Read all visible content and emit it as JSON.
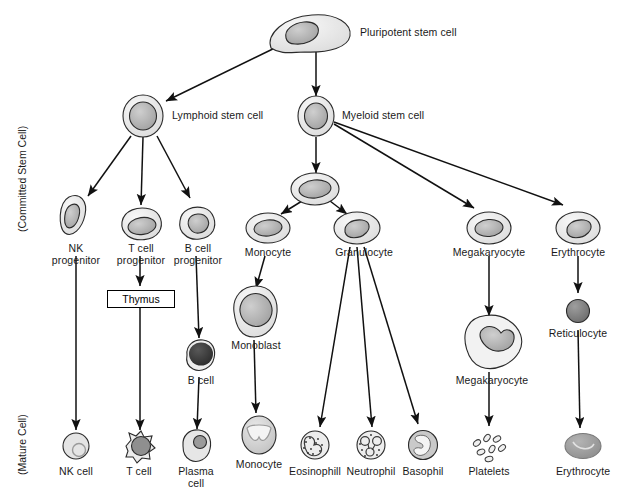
{
  "diagram": {
    "axis_labels": [
      {
        "id": "committed-stem-cell",
        "text": "(Committed Stem Cell)"
      },
      {
        "id": "mature-cell",
        "text": "(Mature Cell)"
      }
    ],
    "box": {
      "thymus": "Thymus"
    },
    "nodes": [
      {
        "id": "pluripotent-stem-cell",
        "label": "Pluripotent stem cell",
        "shape": "blob",
        "x": 305,
        "y": 33
      },
      {
        "id": "lymphoid-stem-cell",
        "label": "Lymphoid stem cell",
        "shape": "round-halo",
        "x": 143,
        "y": 115
      },
      {
        "id": "myeloid-stem-cell",
        "label": "Myeloid stem cell",
        "shape": "round-halo",
        "x": 316,
        "y": 115
      },
      {
        "id": "nk-progenitor",
        "label": "NK\nprogenitor",
        "shape": "oval-tilt",
        "x": 76,
        "y": 215
      },
      {
        "id": "t-cell-progenitor",
        "label": "T cell\nprogenitor",
        "shape": "oval",
        "x": 140,
        "y": 224
      },
      {
        "id": "b-cell-progenitor",
        "label": "B cell\nprogenitor",
        "shape": "oval",
        "x": 196,
        "y": 224
      },
      {
        "id": "myeloid-intermediate",
        "label": "",
        "shape": "oval-halo",
        "x": 315,
        "y": 190
      },
      {
        "id": "monocyte-precursor",
        "label": "Monocyte",
        "shape": "oval-halo",
        "x": 268,
        "y": 227
      },
      {
        "id": "granulocyte",
        "label": "Granulocyte",
        "shape": "oval-halo",
        "x": 357,
        "y": 227
      },
      {
        "id": "megakaryocyte-precursor",
        "label": "Megakaryocyte",
        "shape": "oval-halo",
        "x": 489,
        "y": 227
      },
      {
        "id": "erythrocyte-precursor",
        "label": "Erythrocyte",
        "shape": "oval-halo",
        "x": 578,
        "y": 227
      },
      {
        "id": "b-cell",
        "label": "B cell",
        "shape": "dark-nucleus",
        "x": 203,
        "y": 357
      },
      {
        "id": "monoblast",
        "label": "Monoblast",
        "shape": "large-oval",
        "x": 254,
        "y": 311
      },
      {
        "id": "megakaryocyte",
        "label": "Megakaryocyte",
        "shape": "amoeboid",
        "x": 492,
        "y": 340
      },
      {
        "id": "reticulocyte",
        "label": "Reticulocyte",
        "shape": "solid-round",
        "x": 578,
        "y": 310
      },
      {
        "id": "nk-cell",
        "label": "NK cell",
        "shape": "pale-round",
        "x": 76,
        "y": 452
      },
      {
        "id": "t-cell",
        "label": "T cell",
        "shape": "spiky-round",
        "x": 139,
        "y": 452
      },
      {
        "id": "plasma-cell",
        "label": "Plasma\ncell",
        "shape": "plasma",
        "x": 196,
        "y": 452
      },
      {
        "id": "monocyte",
        "label": "Monocyte",
        "shape": "kidney-nucleus",
        "x": 259,
        "y": 437
      },
      {
        "id": "eosinophil",
        "label": "Eosinophill",
        "shape": "granular-bilobed",
        "x": 315,
        "y": 452
      },
      {
        "id": "neutrophil",
        "label": "Neutrophil",
        "shape": "granular-multilobed",
        "x": 371,
        "y": 452
      },
      {
        "id": "basophil",
        "label": "Basophil",
        "shape": "basophil",
        "x": 423,
        "y": 452
      },
      {
        "id": "platelets",
        "label": "Platelets",
        "shape": "platelet-cluster",
        "x": 489,
        "y": 452
      },
      {
        "id": "erythrocyte",
        "label": "Erythrocyte",
        "shape": "biconcave-disc",
        "x": 583,
        "y": 452
      }
    ],
    "edges": [
      {
        "from": "pluripotent-stem-cell",
        "to": "lymphoid-stem-cell"
      },
      {
        "from": "pluripotent-stem-cell",
        "to": "myeloid-stem-cell"
      },
      {
        "from": "lymphoid-stem-cell",
        "to": "nk-progenitor"
      },
      {
        "from": "lymphoid-stem-cell",
        "to": "t-cell-progenitor"
      },
      {
        "from": "lymphoid-stem-cell",
        "to": "b-cell-progenitor"
      },
      {
        "from": "myeloid-stem-cell",
        "to": "myeloid-intermediate"
      },
      {
        "from": "myeloid-stem-cell",
        "to": "megakaryocyte-precursor"
      },
      {
        "from": "myeloid-stem-cell",
        "to": "erythrocyte-precursor"
      },
      {
        "from": "myeloid-intermediate",
        "to": "monocyte-precursor"
      },
      {
        "from": "myeloid-intermediate",
        "to": "granulocyte"
      },
      {
        "from": "nk-progenitor",
        "to": "nk-cell"
      },
      {
        "from": "t-cell-progenitor",
        "to": "thymus"
      },
      {
        "from": "thymus",
        "to": "t-cell"
      },
      {
        "from": "b-cell-progenitor",
        "to": "b-cell"
      },
      {
        "from": "b-cell",
        "to": "plasma-cell"
      },
      {
        "from": "monocyte-precursor",
        "to": "monoblast"
      },
      {
        "from": "monoblast",
        "to": "monocyte"
      },
      {
        "from": "granulocyte",
        "to": "eosinophil"
      },
      {
        "from": "granulocyte",
        "to": "neutrophil"
      },
      {
        "from": "granulocyte",
        "to": "basophil"
      },
      {
        "from": "megakaryocyte-precursor",
        "to": "megakaryocyte"
      },
      {
        "from": "megakaryocyte",
        "to": "platelets"
      },
      {
        "from": "erythrocyte-precursor",
        "to": "reticulocyte"
      },
      {
        "from": "reticulocyte",
        "to": "erythrocyte"
      }
    ],
    "colors": {
      "outline": "#1a1a1a",
      "cell_fill_light": "#efefef",
      "cell_fill_mid": "#d9d9d9",
      "nucleus": "#a8a8a8",
      "nucleus_dark": "#3a3a3a",
      "background": "#ffffff"
    }
  }
}
